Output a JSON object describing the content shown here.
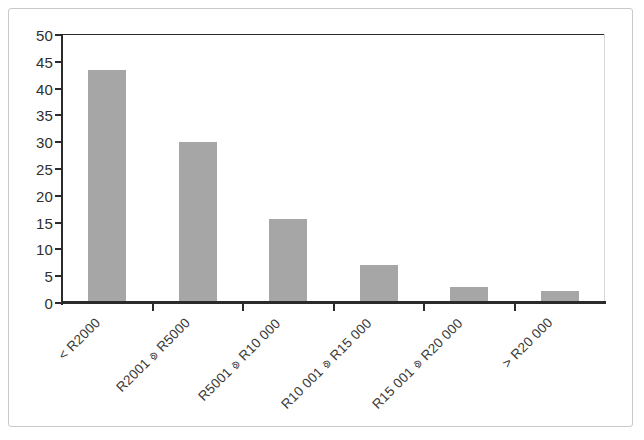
{
  "chart_data": {
    "type": "bar",
    "title": "",
    "subtitle": "",
    "xlabel": "",
    "ylabel": "",
    "categories": [
      "< R2000",
      "R2001 ⟄ R5000",
      "R5001 ⟄ R10 000",
      "R10 001 ⟄ R15 000",
      "R15 001 ⟄ R20 000",
      "> R20 000"
    ],
    "values": [
      43.5,
      30,
      15.7,
      7,
      2.9,
      2.2
    ],
    "ylim": [
      0,
      50
    ],
    "ytick_values": [
      0,
      5,
      10,
      15,
      20,
      25,
      30,
      35,
      40,
      45,
      50
    ],
    "ytick_labels": [
      "0",
      "5",
      "10",
      "15",
      "20",
      "25",
      "30",
      "35",
      "40",
      "45",
      "50"
    ],
    "grid": true,
    "grid_axis": "y",
    "legend": false,
    "legend_position": "none",
    "bar_color": "#a6a6a6",
    "axis_color": "#2b2b2b",
    "grid_color": "#2b2b2b",
    "frame_color": "#c9c9c9",
    "label_rotation": -45
  },
  "axis": {
    "y_ticks": [
      {
        "value": 50,
        "label": "50"
      },
      {
        "value": 45,
        "label": "45"
      },
      {
        "value": 40,
        "label": "40"
      },
      {
        "value": 35,
        "label": "35"
      },
      {
        "value": 30,
        "label": "30"
      },
      {
        "value": 25,
        "label": "25"
      },
      {
        "value": 20,
        "label": "20"
      },
      {
        "value": 15,
        "label": "15"
      },
      {
        "value": 10,
        "label": "10"
      },
      {
        "value": 5,
        "label": "5"
      },
      {
        "value": 0,
        "label": "0"
      }
    ]
  },
  "bars": [
    {
      "label": "< R2000",
      "value": 43.5
    },
    {
      "label": "R2001 ⟄ R5000",
      "value": 30
    },
    {
      "label": "R5001 ⟄ R10 000",
      "value": 15.7
    },
    {
      "label": "R10 001 ⟄ R15 000",
      "value": 7
    },
    {
      "label": "R15 001 ⟄ R20 000",
      "value": 2.9
    },
    {
      "label": "> R20 000",
      "value": 2.2
    }
  ],
  "xlabels": [
    {
      "pre": "< R2000",
      "sep": "",
      "post": ""
    },
    {
      "pre": "R2001",
      "sep": "⟄",
      "post": "R5000"
    },
    {
      "pre": "R5001",
      "sep": "⟄",
      "post": "R10 000"
    },
    {
      "pre": "R10 001",
      "sep": "⟄",
      "post": "R15 000"
    },
    {
      "pre": "R15 001",
      "sep": "⟄",
      "post": "R20 000"
    },
    {
      "pre": "> R20 000",
      "sep": "",
      "post": ""
    }
  ]
}
